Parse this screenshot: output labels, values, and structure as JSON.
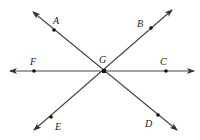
{
  "diagram": {
    "type": "intersecting lines",
    "intersection": {
      "label": "G",
      "x": 104,
      "y": 71,
      "label_x": 99,
      "label_y": 63
    },
    "lines": [
      {
        "name": "line-AD",
        "from": [
          33,
          12
        ],
        "to": [
          177,
          130
        ]
      },
      {
        "name": "line-EB",
        "from": [
          34,
          130
        ],
        "to": [
          172,
          10
        ]
      },
      {
        "name": "line-FC",
        "from": [
          10,
          71
        ],
        "to": [
          194,
          71
        ]
      }
    ],
    "points": [
      {
        "label": "A",
        "x": 54,
        "y": 30,
        "label_x": 53,
        "label_y": 24
      },
      {
        "label": "B",
        "x": 151,
        "y": 28,
        "label_x": 137,
        "label_y": 27
      },
      {
        "label": "C",
        "x": 166,
        "y": 71,
        "label_x": 160,
        "label_y": 65
      },
      {
        "label": "D",
        "x": 158,
        "y": 115,
        "label_x": 145,
        "label_y": 127
      },
      {
        "label": "E",
        "x": 51,
        "y": 117,
        "label_x": 55,
        "label_y": 130
      },
      {
        "label": "F",
        "x": 34,
        "y": 71,
        "label_x": 30,
        "label_y": 65
      }
    ]
  }
}
